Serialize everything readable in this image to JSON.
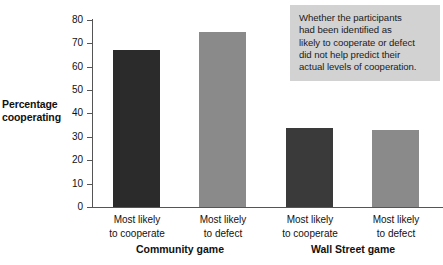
{
  "chart_data": {
    "type": "bar",
    "title": "",
    "xlabel": "",
    "ylabel": "Percentage cooperating",
    "ylim": [
      0,
      80
    ],
    "yticks": [
      0,
      10,
      20,
      30,
      40,
      50,
      60,
      70,
      80
    ],
    "grid": false,
    "legend": "none",
    "groups": [
      {
        "name": "Community game",
        "categories": [
          "Most likely\nto cooperate",
          "Most likely\nto defect"
        ],
        "values": [
          67,
          75
        ]
      },
      {
        "name": "Wall Street game",
        "categories": [
          "Most likely\nto cooperate",
          "Most likely\nto defect"
        ],
        "values": [
          34,
          33
        ]
      }
    ],
    "categories": [
      "Most likely to cooperate",
      "Most likely to defect",
      "Most likely to cooperate",
      "Most likely to defect"
    ],
    "values": [
      67,
      75,
      34,
      33
    ],
    "bar_colors": [
      "#2b2b2b",
      "#8a8a8a",
      "#3a3a3a",
      "#8a8a8a"
    ],
    "annotation": "Whether the participants had been identified as likely to cooperate or defect did not help predict their actual levels of cooperation."
  },
  "axis": {
    "y_title_line1": "Percentage",
    "y_title_line2": "cooperating",
    "tick_labels": [
      "80",
      "70",
      "60",
      "50",
      "40",
      "30",
      "20",
      "10",
      "0"
    ]
  },
  "bars": [
    {
      "label_line1": "Most likely",
      "label_line2": "to cooperate",
      "value": 67,
      "color": "#2b2b2b"
    },
    {
      "label_line1": "Most likely",
      "label_line2": "to defect",
      "value": 75,
      "color": "#8a8a8a"
    },
    {
      "label_line1": "Most likely",
      "label_line2": "to cooperate",
      "value": 34,
      "color": "#3a3a3a"
    },
    {
      "label_line1": "Most likely",
      "label_line2": "to defect",
      "value": 33,
      "color": "#8a8a8a"
    }
  ],
  "groups": [
    {
      "label": "Community game"
    },
    {
      "label": "Wall Street game"
    }
  ],
  "annotation": {
    "line1": "Whether the participants",
    "line2": "had been identified as",
    "line3": "likely to cooperate or defect",
    "line4": "did not help predict their",
    "line5": "actual levels of cooperation.",
    "background": "#d2d2d2"
  }
}
